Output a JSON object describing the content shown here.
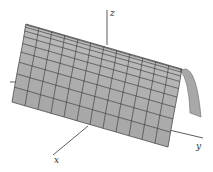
{
  "figure": {
    "axes": {
      "x_label": "x",
      "y_label": "y",
      "z_label": "z"
    },
    "surface": {
      "shape": "parabolic-cylinder",
      "grid_rows": 10,
      "grid_cols": 12,
      "fill_color": "#b4b4b4",
      "fill_color_light": "#c8c8c8",
      "fill_color_dark": "#9a9a9a",
      "end_cap_color": "#a8a8a8",
      "line_color": "#2a2a2a"
    }
  }
}
